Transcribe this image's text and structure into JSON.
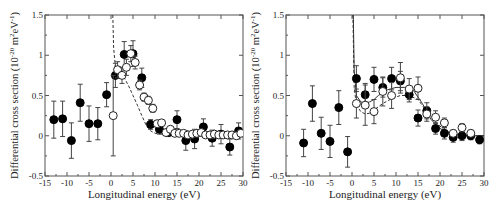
{
  "chart_data": [
    {
      "type": "scatter",
      "title": "",
      "xlabel": "Longitudinal energy (eV)",
      "ylabel": "Differential cross section (10^-20 m^2 eV^-1)",
      "xlim": [
        -15,
        30
      ],
      "ylim": [
        -0.5,
        1.5
      ],
      "xticks": [
        -15,
        -10,
        -5,
        0,
        5,
        10,
        15,
        20,
        25,
        30
      ],
      "yticks": [
        -0.5,
        0,
        0.5,
        1,
        1.5
      ],
      "grid": false,
      "legend": null,
      "series": [
        {
          "name": "filled circles",
          "marker": "filled-circle",
          "points": [
            {
              "x": -13,
              "y": 0.2,
              "err": 0.23
            },
            {
              "x": -11,
              "y": 0.21,
              "err": 0.22
            },
            {
              "x": -9,
              "y": -0.06,
              "err": 0.22
            },
            {
              "x": -7,
              "y": 0.41,
              "err": 0.23
            },
            {
              "x": -5,
              "y": 0.15,
              "err": 0.22
            },
            {
              "x": -3,
              "y": 0.15,
              "err": 0.2
            },
            {
              "x": -1,
              "y": 0.51,
              "err": 0.15
            },
            {
              "x": 1,
              "y": 0.75,
              "err": 0.15
            },
            {
              "x": 3,
              "y": 1.01,
              "err": 0.16
            },
            {
              "x": 5,
              "y": 1.02,
              "err": 0.16
            },
            {
              "x": 7,
              "y": 0.72,
              "err": 0.12
            },
            {
              "x": 9,
              "y": 0.14,
              "err": 0.06
            },
            {
              "x": 11,
              "y": 0.08,
              "err": 0.06
            },
            {
              "x": 13,
              "y": 0.04,
              "err": 0.05
            },
            {
              "x": 15,
              "y": 0.2,
              "err": 0.11
            },
            {
              "x": 17,
              "y": -0.06,
              "err": 0.12
            },
            {
              "x": 19,
              "y": -0.04,
              "err": 0.12
            },
            {
              "x": 21,
              "y": 0.11,
              "err": 0.1
            },
            {
              "x": 23,
              "y": -0.03,
              "err": 0.1
            },
            {
              "x": 25,
              "y": 0.02,
              "err": 0.12
            },
            {
              "x": 27,
              "y": -0.14,
              "err": 0.1
            },
            {
              "x": 29,
              "y": 0.06,
              "err": 0.1
            }
          ]
        },
        {
          "name": "open circles",
          "marker": "open-circle",
          "points": [
            {
              "x": 0.5,
              "y": 0.25,
              "err": 0.5
            },
            {
              "x": 1.5,
              "y": 0.82,
              "err": 0.1
            },
            {
              "x": 2.5,
              "y": 0.75,
              "err": 0.1
            },
            {
              "x": 3.5,
              "y": 0.85,
              "err": 0.1
            },
            {
              "x": 4.5,
              "y": 1.02,
              "err": 0.1
            },
            {
              "x": 5.5,
              "y": 0.91,
              "err": 0.08
            },
            {
              "x": 6.5,
              "y": 0.63,
              "err": 0.06
            },
            {
              "x": 7.5,
              "y": 0.48,
              "err": 0.05
            },
            {
              "x": 8.5,
              "y": 0.44,
              "err": 0.05
            },
            {
              "x": 9.5,
              "y": 0.34,
              "err": 0.05
            },
            {
              "x": 10.5,
              "y": 0.15,
              "err": 0.04
            },
            {
              "x": 11.5,
              "y": 0.16,
              "err": 0.04
            },
            {
              "x": 12.5,
              "y": 0.04,
              "err": 0.03
            },
            {
              "x": 13.5,
              "y": 0.08,
              "err": 0.03
            },
            {
              "x": 14.5,
              "y": 0.03,
              "err": 0.02
            },
            {
              "x": 15.5,
              "y": 0.03,
              "err": 0.02
            },
            {
              "x": 16.5,
              "y": 0.03,
              "err": 0.02
            },
            {
              "x": 17.5,
              "y": 0.01,
              "err": 0.02
            },
            {
              "x": 18.5,
              "y": 0.02,
              "err": 0.02
            },
            {
              "x": 19.5,
              "y": 0.03,
              "err": 0.02
            },
            {
              "x": 20.5,
              "y": 0.04,
              "err": 0.02
            },
            {
              "x": 21.5,
              "y": 0.01,
              "err": 0.02
            },
            {
              "x": 22.5,
              "y": 0.01,
              "err": 0.02
            },
            {
              "x": 23.5,
              "y": 0.02,
              "err": 0.02
            },
            {
              "x": 24.5,
              "y": 0.01,
              "err": 0.02
            },
            {
              "x": 25.5,
              "y": 0.01,
              "err": 0.02
            },
            {
              "x": 26.5,
              "y": 0.01,
              "err": 0.02
            },
            {
              "x": 27.5,
              "y": 0.01,
              "err": 0.02
            },
            {
              "x": 28.5,
              "y": 0.0,
              "err": 0.02
            },
            {
              "x": 29.5,
              "y": 0.03,
              "err": 0.02
            }
          ]
        },
        {
          "name": "dashed theory curve",
          "style": "dashed",
          "points": [
            [
              0.4,
              1.5
            ],
            [
              0.6,
              1.1
            ],
            [
              1,
              0.85
            ],
            [
              2,
              0.77
            ],
            [
              3,
              0.72
            ],
            [
              4,
              0.62
            ],
            [
              5,
              0.5
            ],
            [
              6,
              0.38
            ],
            [
              7,
              0.25
            ],
            [
              8,
              0.13
            ],
            [
              9,
              0.06
            ],
            [
              10,
              0.03
            ],
            [
              12,
              0.02
            ],
            [
              15,
              0.02
            ],
            [
              20,
              0.02
            ],
            [
              25,
              0.02
            ],
            [
              30,
              0.02
            ]
          ]
        }
      ]
    },
    {
      "type": "scatter",
      "title": "",
      "xlabel": "Longitudinal energy (eV)",
      "ylabel": "Differential cross section (10^-20 m^2 eV^-1)",
      "xlim": [
        -15,
        30
      ],
      "ylim": [
        -0.5,
        1.5
      ],
      "xticks": [
        -15,
        -10,
        -5,
        0,
        5,
        10,
        15,
        20,
        25,
        30
      ],
      "yticks": [
        -0.5,
        0,
        0.5,
        1,
        1.5
      ],
      "grid": false,
      "legend": null,
      "series": [
        {
          "name": "filled circles",
          "marker": "filled-circle",
          "points": [
            {
              "x": -11,
              "y": -0.09,
              "err": 0.17
            },
            {
              "x": -9,
              "y": 0.4,
              "err": 0.22
            },
            {
              "x": -7,
              "y": 0.03,
              "err": 0.2
            },
            {
              "x": -5,
              "y": -0.07,
              "err": 0.2
            },
            {
              "x": -3,
              "y": 0.35,
              "err": 0.21
            },
            {
              "x": -1,
              "y": -0.2,
              "err": 0.19
            },
            {
              "x": 1,
              "y": 0.71,
              "err": 0.16
            },
            {
              "x": 3,
              "y": 0.51,
              "err": 0.14
            },
            {
              "x": 5,
              "y": 0.7,
              "err": 0.15
            },
            {
              "x": 7,
              "y": 0.6,
              "err": 0.12
            },
            {
              "x": 9,
              "y": 0.71,
              "err": 0.14
            },
            {
              "x": 11,
              "y": 0.68,
              "err": 0.12
            },
            {
              "x": 13,
              "y": 0.51,
              "err": 0.09
            },
            {
              "x": 15,
              "y": 0.22,
              "err": 0.1
            },
            {
              "x": 17,
              "y": 0.31,
              "err": 0.1
            },
            {
              "x": 19,
              "y": 0.09,
              "err": 0.07
            },
            {
              "x": 21,
              "y": 0.03,
              "err": 0.07
            },
            {
              "x": 23,
              "y": -0.02,
              "err": 0.06
            },
            {
              "x": 25,
              "y": 0.0,
              "err": 0.06
            },
            {
              "x": 27,
              "y": 0.0,
              "err": 0.05
            },
            {
              "x": 29,
              "y": -0.05,
              "err": 0.05
            }
          ]
        },
        {
          "name": "open circles",
          "marker": "open-circle",
          "points": [
            {
              "x": 1,
              "y": 0.4,
              "err": 0.18
            },
            {
              "x": 3,
              "y": 0.38,
              "err": 0.25
            },
            {
              "x": 5,
              "y": 0.3,
              "err": 0.15
            },
            {
              "x": 7,
              "y": 0.55,
              "err": 0.18
            },
            {
              "x": 9,
              "y": 0.5,
              "err": 0.16
            },
            {
              "x": 11,
              "y": 0.72,
              "err": 0.19
            },
            {
              "x": 13,
              "y": 0.58,
              "err": 0.13
            },
            {
              "x": 15,
              "y": 0.59,
              "err": 0.14
            },
            {
              "x": 17,
              "y": 0.27,
              "err": 0.09
            },
            {
              "x": 19,
              "y": 0.23,
              "err": 0.08
            },
            {
              "x": 21,
              "y": 0.16,
              "err": 0.06
            },
            {
              "x": 23,
              "y": 0.03,
              "err": 0.04
            },
            {
              "x": 25,
              "y": 0.1,
              "err": 0.05
            },
            {
              "x": 27,
              "y": 0.03,
              "err": 0.04
            }
          ]
        },
        {
          "name": "solid theory curve",
          "style": "solid",
          "points": [
            [
              0.3,
              1.5
            ],
            [
              0.5,
              0.8
            ],
            [
              1,
              0.5
            ],
            [
              2,
              0.42
            ],
            [
              3,
              0.4
            ],
            [
              4,
              0.42
            ],
            [
              5,
              0.45
            ],
            [
              6,
              0.5
            ],
            [
              8,
              0.57
            ],
            [
              10,
              0.6
            ],
            [
              12,
              0.6
            ],
            [
              14,
              0.56
            ],
            [
              16,
              0.4
            ],
            [
              18,
              0.2
            ],
            [
              20,
              0.09
            ],
            [
              22,
              0.03
            ],
            [
              24,
              0.01
            ],
            [
              26,
              0.0
            ],
            [
              30,
              0.0
            ]
          ]
        },
        {
          "name": "dashed theory curve",
          "style": "dashed",
          "points": [
            [
              0.2,
              1.5
            ],
            [
              0.5,
              0.6
            ],
            [
              1,
              0.38
            ],
            [
              2,
              0.3
            ],
            [
              3,
              0.27
            ],
            [
              4,
              0.28
            ],
            [
              5,
              0.32
            ],
            [
              7,
              0.4
            ],
            [
              9,
              0.46
            ],
            [
              11,
              0.5
            ],
            [
              13,
              0.5
            ],
            [
              15,
              0.45
            ],
            [
              17,
              0.3
            ],
            [
              19,
              0.17
            ],
            [
              21,
              0.07
            ],
            [
              23,
              0.02
            ],
            [
              25,
              0.01
            ],
            [
              30,
              0.0
            ]
          ]
        }
      ]
    }
  ]
}
